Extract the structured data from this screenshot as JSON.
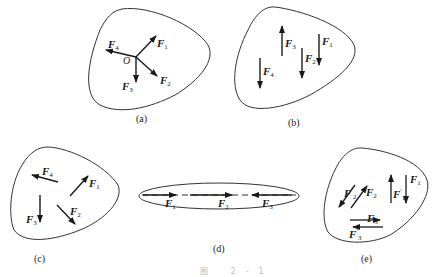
{
  "figure": {
    "caption": "图 2-1",
    "panels": [
      {
        "id": "a",
        "label": "(a)",
        "description": "Concurrent force system: four forces acting at common point O",
        "point": "O",
        "forces": [
          {
            "name": "F",
            "sub": "1",
            "direction": "up-right"
          },
          {
            "name": "F",
            "sub": "2",
            "direction": "down-right"
          },
          {
            "name": "F",
            "sub": "3",
            "direction": "down"
          },
          {
            "name": "F",
            "sub": "4",
            "direction": "left"
          }
        ]
      },
      {
        "id": "b",
        "label": "(b)",
        "description": "Parallel force system",
        "forces": [
          {
            "name": "F",
            "sub": "1",
            "direction": "down"
          },
          {
            "name": "F",
            "sub": "2",
            "direction": "down"
          },
          {
            "name": "F",
            "sub": "3",
            "direction": "up"
          },
          {
            "name": "F",
            "sub": "4",
            "direction": "down"
          }
        ]
      },
      {
        "id": "c",
        "label": "(c)",
        "description": "General (arbitrary) force system",
        "forces": [
          {
            "name": "F",
            "sub": "1",
            "direction": "up-right"
          },
          {
            "name": "F",
            "sub": "2",
            "direction": "down-right"
          },
          {
            "name": "F",
            "sub": "3",
            "direction": "down"
          },
          {
            "name": "F",
            "sub": "4",
            "direction": "left"
          }
        ]
      },
      {
        "id": "d",
        "label": "(d)",
        "description": "Collinear force system along a dashed line",
        "forces": [
          {
            "name": "F",
            "sub": "1",
            "direction": "right"
          },
          {
            "name": "F",
            "sub": "2",
            "direction": "right"
          },
          {
            "name": "F",
            "sub": "3",
            "direction": "left"
          }
        ]
      },
      {
        "id": "e",
        "label": "(e)",
        "description": "Couple system: pairs of equal and opposite parallel forces",
        "forces": [
          {
            "name": "F",
            "sub": "1",
            "prime": false,
            "direction": "down"
          },
          {
            "name": "F",
            "sub": "1",
            "prime": true,
            "direction": "up"
          },
          {
            "name": "F",
            "sub": "2",
            "prime": false,
            "direction": "up-right"
          },
          {
            "name": "F",
            "sub": "2",
            "prime": true,
            "direction": "down-left"
          },
          {
            "name": "F",
            "sub": "3",
            "prime": false,
            "direction": "right"
          },
          {
            "name": "F",
            "sub": "3",
            "prime": true,
            "direction": "left"
          }
        ]
      }
    ]
  }
}
